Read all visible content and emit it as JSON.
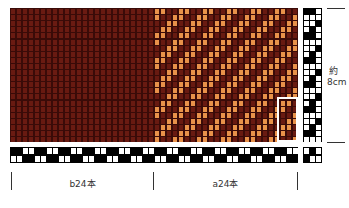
{
  "colors": {
    "dark": "#6a1b12",
    "light": "#e8924a",
    "gap": "#3a0b08"
  },
  "labels": {
    "left_section": "b24本",
    "right_section": "a24本",
    "size_top": "約",
    "size_bottom": "8cm"
  },
  "grid": {
    "cols": 48,
    "rows": 22,
    "left_count": 24,
    "right_count": 24
  }
}
